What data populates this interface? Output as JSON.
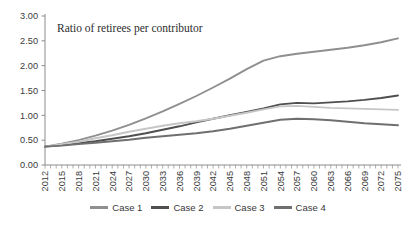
{
  "chart_data": {
    "type": "line",
    "title": "Ratio of retirees per contributor",
    "xlabel": "",
    "ylabel": "",
    "grid": false,
    "legend_position": "bottom",
    "ylim": [
      0,
      3
    ],
    "ytick_step": 0.5,
    "ytick_labels": [
      "0.00",
      "0.50",
      "1.00",
      "1.50",
      "2.00",
      "2.50",
      "3.00"
    ],
    "x_label_every_years": 3,
    "x_minor_tick_every_years": 1,
    "x": [
      2012,
      2015,
      2018,
      2021,
      2024,
      2027,
      2030,
      2033,
      2036,
      2039,
      2042,
      2045,
      2048,
      2051,
      2054,
      2057,
      2060,
      2063,
      2066,
      2069,
      2072,
      2075
    ],
    "series": [
      {
        "name": "Case 1",
        "color": "#8f8f8f",
        "values": [
          0.37,
          0.43,
          0.5,
          0.59,
          0.69,
          0.81,
          0.94,
          1.08,
          1.23,
          1.39,
          1.56,
          1.74,
          1.93,
          2.1,
          2.19,
          2.24,
          2.28,
          2.32,
          2.36,
          2.41,
          2.47,
          2.55
        ]
      },
      {
        "name": "Case 2",
        "color": "#4f4f4f",
        "values": [
          0.37,
          0.4,
          0.44,
          0.48,
          0.53,
          0.58,
          0.64,
          0.71,
          0.78,
          0.86,
          0.93,
          1.0,
          1.07,
          1.14,
          1.22,
          1.25,
          1.24,
          1.26,
          1.28,
          1.31,
          1.35,
          1.4
        ]
      },
      {
        "name": "Case 3",
        "color": "#c6c6c6",
        "values": [
          0.37,
          0.42,
          0.47,
          0.54,
          0.6,
          0.67,
          0.73,
          0.79,
          0.84,
          0.88,
          0.93,
          0.99,
          1.05,
          1.12,
          1.18,
          1.19,
          1.17,
          1.15,
          1.14,
          1.13,
          1.12,
          1.11
        ]
      },
      {
        "name": "Case 4",
        "color": "#6f6f6f",
        "values": [
          0.37,
          0.39,
          0.42,
          0.45,
          0.48,
          0.51,
          0.55,
          0.58,
          0.61,
          0.64,
          0.68,
          0.73,
          0.79,
          0.85,
          0.91,
          0.93,
          0.92,
          0.9,
          0.87,
          0.84,
          0.82,
          0.8
        ]
      }
    ],
    "axis_color": "#8c8c8c",
    "tick_label_color": "#3a3a3a"
  }
}
